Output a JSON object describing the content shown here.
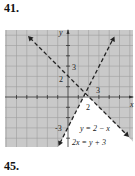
{
  "problems": [
    {
      "number": "41."
    },
    {
      "number": "45."
    }
  ],
  "graph": {
    "x_axis_label": "x",
    "y_axis_label": "y",
    "tick_labels": {
      "y_intercept_line1": "2",
      "y_tick_3": "3",
      "y_intercept_line2": "-3",
      "x_intercept": "2",
      "x_tick_3": "3"
    },
    "lines": [
      {
        "equation": "y = 2 − x",
        "style": "dashed",
        "slope": -1,
        "intercept": 2
      },
      {
        "equation": "2x = y + 3",
        "style": "dashed",
        "slope": 2,
        "intercept": -3
      }
    ],
    "shading_color": "#c9c9c9",
    "unshaded_region": "y < 2 − x and y < 2x − 3"
  }
}
